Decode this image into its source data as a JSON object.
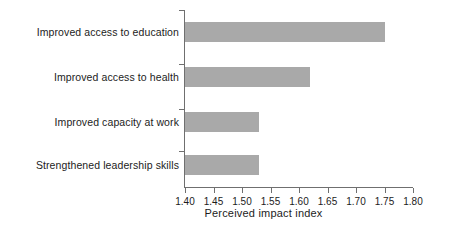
{
  "chart_data": {
    "type": "bar",
    "orientation": "horizontal",
    "title": "",
    "xlabel": "Perceived impact index",
    "ylabel": "",
    "categories": [
      "Improved access to education",
      "Improved access to health",
      "Improved capacity at work",
      "Strengthened leadership skills"
    ],
    "values": [
      1.75,
      1.62,
      1.53,
      1.53
    ],
    "xlim": [
      1.4,
      1.8
    ],
    "xticks": [
      1.4,
      1.45,
      1.5,
      1.55,
      1.6,
      1.65,
      1.7,
      1.75,
      1.8
    ],
    "xtick_labels": [
      "1.40",
      "1.45",
      "1.50",
      "1.55",
      "1.60",
      "1.65",
      "1.70",
      "1.75",
      "1.80"
    ],
    "grid": false,
    "legend": null,
    "bar_color": "#a9a9a9",
    "axis_color": "#6f6f6f",
    "background": "#ffffff"
  }
}
